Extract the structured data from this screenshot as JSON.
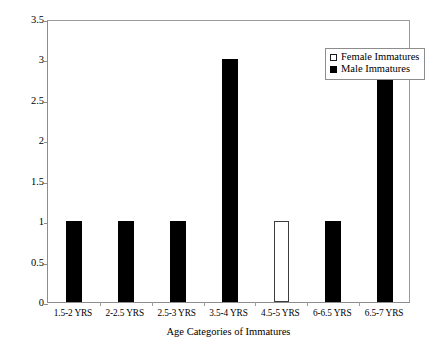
{
  "chart_data": {
    "type": "bar",
    "title": "",
    "xlabel": "Age Categories of  Immatures",
    "ylabel": "Number of Interactions",
    "categories": [
      "1.5-2 YRS",
      "2-2.5 YRS",
      "2.5-3 YRS",
      "3.5-4 YRS",
      "4.5-5 YRS",
      "6-6.5 YRS",
      "6.5-7 YRS"
    ],
    "series": [
      {
        "name": "Female Immatures",
        "color": "#ffffff",
        "edge_color": "#000000",
        "values": [
          0,
          0,
          0,
          0,
          1,
          0,
          0
        ]
      },
      {
        "name": "Male Immatures",
        "color": "#000000",
        "edge_color": "#000000",
        "values": [
          1,
          1,
          1,
          3,
          0,
          1,
          3
        ]
      }
    ],
    "ylim": [
      0,
      3.5
    ],
    "y_ticks": [
      "0",
      "0.5",
      "1",
      "1.5",
      "2",
      "2.5",
      "3",
      "3.5"
    ],
    "y_tick_values": [
      0,
      0.5,
      1,
      1.5,
      2,
      2.5,
      3,
      3.5
    ],
    "grid": false,
    "legend_position": "top-right",
    "legend_entries": [
      {
        "label": "Female Immatures",
        "swatch": "open-square"
      },
      {
        "label": "Male Immatures",
        "swatch": "filled-square"
      }
    ]
  },
  "figure": {
    "caption": ""
  }
}
